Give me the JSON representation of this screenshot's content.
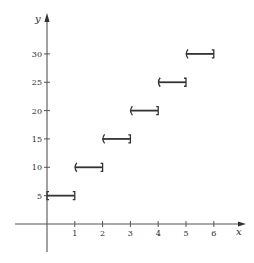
{
  "chart_data": {
    "type": "line",
    "subtype": "step-function",
    "title": "",
    "xlabel": "x",
    "ylabel": "y",
    "x_ticks": [
      "1",
      "2",
      "3",
      "4",
      "5",
      "6"
    ],
    "y_ticks": [
      "5",
      "10",
      "15",
      "20",
      "25",
      "30"
    ],
    "xlim": [
      -1,
      7
    ],
    "ylim": [
      -8,
      35
    ],
    "grid": false,
    "legend": null,
    "segments": [
      {
        "x_start": 0,
        "x_end": 1,
        "y": 5,
        "left": "closed",
        "right": "closed"
      },
      {
        "x_start": 1,
        "x_end": 2,
        "y": 10,
        "left": "open",
        "right": "closed"
      },
      {
        "x_start": 2,
        "x_end": 3,
        "y": 15,
        "left": "open",
        "right": "closed"
      },
      {
        "x_start": 3,
        "x_end": 4,
        "y": 20,
        "left": "open",
        "right": "closed"
      },
      {
        "x_start": 4,
        "x_end": 5,
        "y": 25,
        "left": "open",
        "right": "closed"
      },
      {
        "x_start": 5,
        "x_end": 6,
        "y": 30,
        "left": "open",
        "right": "closed"
      }
    ],
    "colors": {
      "axis": "#555555",
      "segment": "#333333",
      "text": "#2a2a2a"
    }
  }
}
